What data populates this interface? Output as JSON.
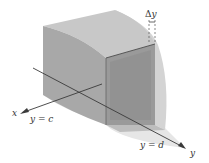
{
  "figure": {
    "type": "3d-solid-slice-diagram",
    "labels": {
      "delta": "Δ",
      "delta_var": "y",
      "x_axis": "x",
      "y_axis": "y",
      "y_eq_c": "y = c",
      "y_eq_d": "y = d"
    },
    "colors": {
      "background": "#ffffff",
      "solid_light": "#d2d2d2",
      "solid_mid": "#b4b4b4",
      "solid_dark": "#8e8e8e",
      "slab_face": "#999999",
      "axis_line": "#3a3a3a",
      "text": "#333333"
    }
  }
}
